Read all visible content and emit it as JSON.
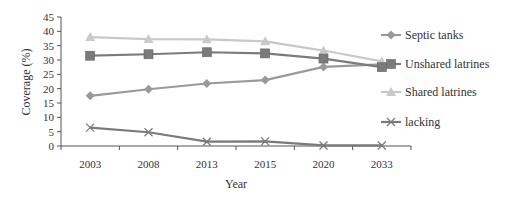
{
  "chart_data": {
    "type": "line",
    "title": "",
    "xlabel": "Year",
    "ylabel": "Coverage (%)",
    "categories": [
      "2003",
      "2008",
      "2013",
      "2015",
      "2020",
      "2033"
    ],
    "ylim": [
      0,
      45
    ],
    "yticks": [
      0,
      5,
      10,
      15,
      20,
      25,
      30,
      35,
      40,
      45
    ],
    "grid": false,
    "legend_position": "right",
    "series": [
      {
        "name": "Septic tanks",
        "marker": "diamond",
        "color": "#9a9a9a",
        "values": [
          17.5,
          19.8,
          21.8,
          23.0,
          27.6,
          28.5
        ]
      },
      {
        "name": "Unshared latrines",
        "marker": "square",
        "color": "#7b7b7b",
        "values": [
          31.5,
          32.0,
          32.7,
          32.3,
          30.5,
          27.5
        ]
      },
      {
        "name": "Shared latrines",
        "marker": "triangle",
        "color": "#c9c9c9",
        "values": [
          38.0,
          37.3,
          37.2,
          36.5,
          33.3,
          29.5
        ]
      },
      {
        "name": "lacking",
        "marker": "x",
        "color": "#7a7a7a",
        "values": [
          6.4,
          4.8,
          1.5,
          1.6,
          0.2,
          0.2
        ]
      }
    ]
  }
}
